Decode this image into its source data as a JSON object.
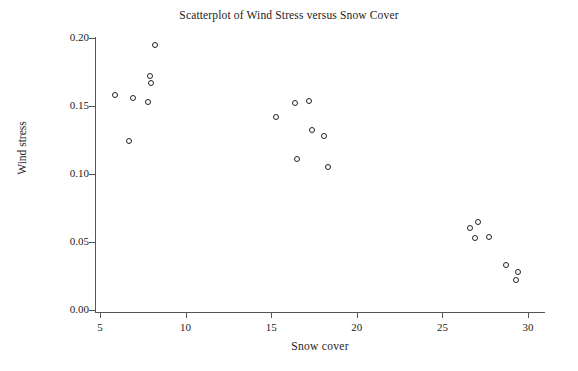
{
  "chart_data": {
    "type": "scatter",
    "title": "Scatterplot of Wind Stress versus Snow Cover",
    "xlabel": "Snow cover",
    "ylabel": "Wind stress",
    "xlim": [
      4.2,
      30.8
    ],
    "ylim": [
      0.0,
      0.207
    ],
    "xticks": [
      5,
      10,
      15,
      20,
      25,
      30
    ],
    "xtick_labels": [
      "5",
      "10",
      "15",
      "20",
      "25",
      "30"
    ],
    "yticks": [
      0.0,
      0.05,
      0.1,
      0.15,
      0.2
    ],
    "ytick_labels": [
      "0.00",
      "0.05",
      "0.10",
      "0.15",
      "0.20"
    ],
    "grid": false,
    "legend": null,
    "marker": "open-circle",
    "marker_color": "#222222",
    "n_points": 21,
    "points": [
      {
        "x": 5.9,
        "y": 0.158
      },
      {
        "x": 6.9,
        "y": 0.156
      },
      {
        "x": 6.7,
        "y": 0.124
      },
      {
        "x": 7.8,
        "y": 0.153
      },
      {
        "x": 8.2,
        "y": 0.195
      },
      {
        "x": 7.9,
        "y": 0.172
      },
      {
        "x": 8.0,
        "y": 0.167
      },
      {
        "x": 15.3,
        "y": 0.142
      },
      {
        "x": 16.4,
        "y": 0.152
      },
      {
        "x": 17.2,
        "y": 0.154
      },
      {
        "x": 16.5,
        "y": 0.111
      },
      {
        "x": 17.4,
        "y": 0.132
      },
      {
        "x": 18.1,
        "y": 0.128
      },
      {
        "x": 18.3,
        "y": 0.105
      },
      {
        "x": 26.6,
        "y": 0.06
      },
      {
        "x": 27.1,
        "y": 0.065
      },
      {
        "x": 26.9,
        "y": 0.053
      },
      {
        "x": 27.7,
        "y": 0.054
      },
      {
        "x": 28.7,
        "y": 0.033
      },
      {
        "x": 29.4,
        "y": 0.028
      },
      {
        "x": 29.3,
        "y": 0.022
      }
    ]
  }
}
